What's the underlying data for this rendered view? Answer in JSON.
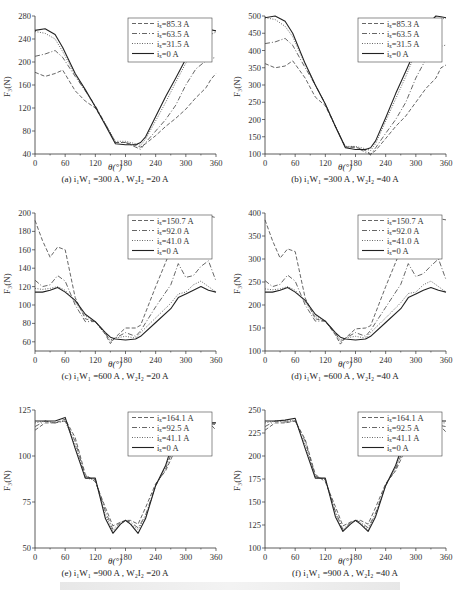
{
  "figure_caption": "",
  "chart_data": [
    {
      "id": "a",
      "type": "line",
      "caption": "(a) i₁W₁ =300 A , W₂I₂ =20 A",
      "xlabel": "θ(°)",
      "ylabel": "F₃(N)",
      "xlim": [
        0,
        360
      ],
      "ylim": [
        40,
        280
      ],
      "xticks": [
        0,
        60,
        120,
        180,
        240,
        300,
        360
      ],
      "yticks": [
        40,
        80,
        120,
        160,
        200,
        240,
        280
      ],
      "legend_position": "upper right",
      "x": [
        0,
        20,
        40,
        55,
        80,
        100,
        120,
        140,
        160,
        180,
        200,
        210,
        220,
        240,
        260,
        280,
        300,
        320,
        340,
        350,
        360
      ],
      "series": [
        {
          "name": "iₓ=85.3 A",
          "style": "dashed",
          "values": [
            182,
            175,
            180,
            186,
            150,
            132,
            120,
            92,
            60,
            60,
            55,
            52,
            58,
            72,
            88,
            102,
            118,
            138,
            155,
            170,
            180
          ]
        },
        {
          "name": "iₓ=63.5 A",
          "style": "dashdot",
          "values": [
            210,
            214,
            220,
            208,
            175,
            150,
            124,
            92,
            60,
            60,
            52,
            48,
            60,
            80,
            100,
            125,
            160,
            188,
            202,
            206,
            208
          ]
        },
        {
          "name": "iₓ=31.5 A",
          "style": "dotted",
          "values": [
            253,
            250,
            240,
            218,
            178,
            150,
            122,
            92,
            62,
            62,
            58,
            55,
            66,
            98,
            130,
            165,
            198,
            222,
            240,
            248,
            252
          ]
        },
        {
          "name": "iₓ=0 A",
          "style": "solid",
          "values": [
            255,
            258,
            248,
            225,
            180,
            152,
            122,
            90,
            58,
            56,
            56,
            60,
            70,
            105,
            140,
            172,
            205,
            240,
            256,
            256,
            254
          ]
        }
      ]
    },
    {
      "id": "b",
      "type": "line",
      "caption": "(b) i₁W₁ =300 A , W₂I₂ =40 A",
      "xlabel": "θ(°)",
      "ylabel": "F₃(N)",
      "xlim": [
        0,
        360
      ],
      "ylim": [
        100,
        500
      ],
      "xticks": [
        0,
        60,
        120,
        180,
        240,
        300,
        360
      ],
      "yticks": [
        100,
        150,
        200,
        250,
        300,
        350,
        400,
        450,
        500
      ],
      "legend_position": "upper right",
      "x": [
        0,
        20,
        40,
        55,
        80,
        100,
        120,
        140,
        160,
        180,
        200,
        210,
        220,
        240,
        260,
        280,
        300,
        320,
        340,
        350,
        360
      ],
      "series": [
        {
          "name": "iₓ=85.3 A",
          "style": "dashed",
          "values": [
            362,
            350,
            355,
            370,
            320,
            265,
            240,
            180,
            120,
            120,
            110,
            100,
            110,
            145,
            180,
            210,
            250,
            290,
            320,
            350,
            358
          ]
        },
        {
          "name": "iₓ=63.5 A",
          "style": "dashdot",
          "values": [
            420,
            425,
            435,
            415,
            350,
            300,
            245,
            180,
            120,
            120,
            105,
            98,
            118,
            160,
            200,
            250,
            320,
            375,
            405,
            412,
            416
          ]
        },
        {
          "name": "iₓ=31.5 A",
          "style": "dotted",
          "values": [
            495,
            490,
            470,
            440,
            360,
            300,
            245,
            180,
            122,
            122,
            115,
            110,
            130,
            195,
            260,
            325,
            395,
            445,
            480,
            490,
            495
          ]
        },
        {
          "name": "iₓ=0 A",
          "style": "solid",
          "values": [
            495,
            500,
            485,
            450,
            362,
            300,
            245,
            180,
            118,
            113,
            113,
            118,
            138,
            205,
            275,
            340,
            405,
            470,
            500,
            498,
            495
          ]
        }
      ]
    },
    {
      "id": "c",
      "type": "line",
      "caption": "(c) i₁W₁ =600 A , W₂I₂ =20 A",
      "xlabel": "θ(°)",
      "ylabel": "F₃(N)",
      "xlim": [
        0,
        360
      ],
      "ylim": [
        50,
        200
      ],
      "xticks": [
        0,
        60,
        120,
        180,
        240,
        300,
        360
      ],
      "yticks": [
        60,
        80,
        100,
        120,
        140,
        160,
        180,
        200
      ],
      "legend_position": "upper right",
      "x": [
        0,
        15,
        30,
        45,
        60,
        80,
        100,
        120,
        140,
        150,
        160,
        180,
        200,
        210,
        240,
        270,
        285,
        300,
        315,
        330,
        345,
        360
      ],
      "series": [
        {
          "name": "iₓ=150.7 A",
          "style": "dashed",
          "values": [
            192,
            170,
            152,
            163,
            160,
            108,
            85,
            82,
            68,
            58,
            65,
            75,
            75,
            78,
            120,
            160,
            185,
            193,
            196,
            185,
            197,
            195
          ]
        },
        {
          "name": "iₓ=92.0 A",
          "style": "dashdot",
          "values": [
            127,
            120,
            122,
            132,
            126,
            100,
            82,
            82,
            70,
            60,
            64,
            70,
            66,
            72,
            98,
            122,
            145,
            130,
            132,
            142,
            148,
            126
          ]
        },
        {
          "name": "iₓ=41.0 A",
          "style": "dotted",
          "values": [
            118,
            117,
            118,
            120,
            116,
            103,
            88,
            82,
            68,
            62,
            64,
            66,
            64,
            70,
            86,
            102,
            112,
            114,
            122,
            126,
            120,
            114
          ]
        },
        {
          "name": "iₓ=0 A",
          "style": "solid",
          "values": [
            114,
            114,
            116,
            119,
            114,
            105,
            90,
            82,
            70,
            65,
            63,
            62,
            63,
            66,
            81,
            96,
            108,
            112,
            116,
            120,
            116,
            114
          ]
        }
      ]
    },
    {
      "id": "d",
      "type": "line",
      "caption": "(d) i₁W₁ =600 A , W₂I₂ =40 A",
      "xlabel": "θ(°)",
      "ylabel": "F₃(N)",
      "xlim": [
        0,
        360
      ],
      "ylim": [
        100,
        400
      ],
      "xticks": [
        0,
        60,
        120,
        180,
        240,
        300,
        360
      ],
      "yticks": [
        100,
        150,
        200,
        250,
        300,
        350,
        400
      ],
      "legend_position": "upper right",
      "x": [
        0,
        15,
        30,
        45,
        60,
        80,
        100,
        120,
        140,
        150,
        160,
        180,
        200,
        210,
        240,
        270,
        285,
        300,
        315,
        330,
        345,
        360
      ],
      "series": [
        {
          "name": "iₓ=150.7 A",
          "style": "dashed",
          "values": [
            385,
            340,
            302,
            322,
            316,
            215,
            170,
            165,
            135,
            115,
            128,
            148,
            150,
            155,
            240,
            320,
            365,
            385,
            388,
            365,
            388,
            385
          ]
        },
        {
          "name": "iₓ=92.0 A",
          "style": "dashdot",
          "values": [
            253,
            240,
            245,
            265,
            252,
            200,
            165,
            165,
            140,
            120,
            128,
            140,
            132,
            145,
            195,
            245,
            290,
            262,
            268,
            285,
            300,
            255
          ]
        },
        {
          "name": "iₓ=41.0 A",
          "style": "dotted",
          "values": [
            235,
            233,
            235,
            240,
            232,
            206,
            175,
            165,
            136,
            124,
            128,
            132,
            128,
            140,
            172,
            205,
            225,
            228,
            244,
            252,
            240,
            228
          ]
        },
        {
          "name": "iₓ=0 A",
          "style": "solid",
          "values": [
            228,
            228,
            232,
            238,
            228,
            210,
            180,
            165,
            140,
            130,
            126,
            124,
            126,
            132,
            162,
            192,
            216,
            224,
            232,
            238,
            232,
            228
          ]
        }
      ]
    },
    {
      "id": "e",
      "type": "line",
      "caption": "(e) i₁W₁ =900 A , W₂I₂ =20 A",
      "xlabel": "θ(°)",
      "ylabel": "F₃(N)",
      "xlim": [
        0,
        360
      ],
      "ylim": [
        50,
        125
      ],
      "xticks": [
        0,
        60,
        120,
        180,
        240,
        300,
        360
      ],
      "yticks": [
        50,
        75,
        100,
        125
      ],
      "legend_position": "upper right",
      "x": [
        0,
        20,
        40,
        60,
        80,
        100,
        120,
        140,
        155,
        170,
        180,
        190,
        205,
        220,
        240,
        260,
        280,
        300,
        320,
        340,
        360
      ],
      "series": [
        {
          "name": "iₓ=164.1 A",
          "style": "dashed",
          "values": [
            114,
            118,
            118,
            120,
            110,
            90,
            86,
            72,
            62,
            64,
            65,
            65,
            63,
            72,
            85,
            92,
            104,
            118,
            122,
            120,
            114
          ]
        },
        {
          "name": "iₓ=92.5 A",
          "style": "dashdot",
          "values": [
            116,
            119,
            118,
            119,
            108,
            89,
            87,
            70,
            60,
            64,
            65,
            64,
            61,
            68,
            84,
            93,
            108,
            120,
            121,
            118,
            117
          ]
        },
        {
          "name": "iₓ=41.1 A",
          "style": "dotted",
          "values": [
            118,
            119,
            118,
            119,
            106,
            88,
            87,
            68,
            59,
            63,
            65,
            63,
            60,
            67,
            84,
            94,
            110,
            121,
            121,
            118,
            118
          ]
        },
        {
          "name": "iₓ=0 A",
          "style": "solid",
          "values": [
            119,
            119,
            119,
            121,
            104,
            88,
            88,
            66,
            58,
            63,
            65,
            63,
            58,
            66,
            84,
            95,
            112,
            120,
            121,
            118,
            118
          ]
        }
      ]
    },
    {
      "id": "f",
      "type": "line",
      "caption": "(f) i₁W₁ =900 A , W₂I₂ =40 A",
      "xlabel": "θ(°)",
      "ylabel": "F₃(N)",
      "xlim": [
        0,
        360
      ],
      "ylim": [
        100,
        250
      ],
      "xticks": [
        0,
        60,
        120,
        180,
        240,
        300,
        360
      ],
      "yticks": [
        100,
        125,
        150,
        175,
        200,
        225,
        250
      ],
      "legend_position": "upper right",
      "x": [
        0,
        20,
        40,
        60,
        80,
        100,
        120,
        140,
        155,
        170,
        180,
        190,
        205,
        220,
        240,
        260,
        280,
        300,
        320,
        340,
        360
      ],
      "series": [
        {
          "name": "iₓ=164.1 A",
          "style": "dashed",
          "values": [
            228,
            236,
            236,
            238,
            218,
            180,
            172,
            145,
            124,
            128,
            130,
            130,
            126,
            144,
            170,
            184,
            208,
            236,
            244,
            238,
            226
          ]
        },
        {
          "name": "iₓ=92.5 A",
          "style": "dashdot",
          "values": [
            232,
            238,
            237,
            238,
            216,
            178,
            174,
            140,
            120,
            128,
            130,
            128,
            122,
            138,
            168,
            186,
            214,
            238,
            242,
            234,
            232
          ]
        },
        {
          "name": "iₓ=41.1 A",
          "style": "dotted",
          "values": [
            236,
            238,
            238,
            239,
            212,
            177,
            175,
            138,
            119,
            127,
            130,
            127,
            120,
            136,
            168,
            188,
            218,
            240,
            242,
            236,
            236
          ]
        },
        {
          "name": "iₓ=0 A",
          "style": "solid",
          "values": [
            238,
            238,
            239,
            241,
            208,
            176,
            176,
            134,
            118,
            126,
            130,
            126,
            118,
            134,
            168,
            190,
            222,
            240,
            242,
            238,
            238
          ]
        }
      ]
    }
  ]
}
